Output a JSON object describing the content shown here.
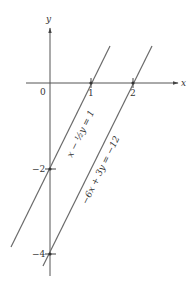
{
  "axes": {
    "x_label": "x",
    "y_label": "y",
    "origin_label": "0"
  },
  "ticks": {
    "x": [
      {
        "value": 1,
        "label": "1"
      },
      {
        "value": 2,
        "label": "2"
      }
    ],
    "y": [
      {
        "value": -2,
        "label": "−2"
      },
      {
        "value": -4,
        "label": "−4"
      }
    ]
  },
  "lines": [
    {
      "name": "line-1",
      "equation": "x − ½y = 1",
      "x_intercept": 1,
      "y_intercept": -2
    },
    {
      "name": "line-2",
      "equation": "−6x + 3y = −12",
      "x_intercept": 2,
      "y_intercept": -4
    }
  ],
  "colors": {
    "axis": "#555555",
    "line": "#6a6a6a",
    "text": "#333333"
  }
}
